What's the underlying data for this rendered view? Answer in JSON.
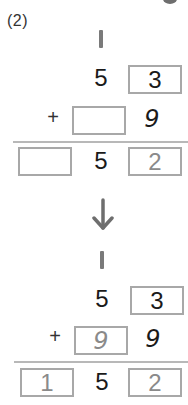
{
  "problem": {
    "label": "(2)"
  },
  "before": {
    "carry": "1",
    "top_row": {
      "tens": "5",
      "ones_box": "3"
    },
    "operator": "+",
    "second_row": {
      "tens_box": "",
      "ones": "9"
    },
    "result_row": {
      "hundreds_box": "",
      "tens": "5",
      "ones_box": "2"
    }
  },
  "transition": {
    "icon": "arrow-down-icon",
    "glyph": "↓"
  },
  "after": {
    "carry": "1",
    "top_row": {
      "tens": "5",
      "ones_box": "3"
    },
    "operator": "+",
    "second_row": {
      "tens_box": "9",
      "ones": "9"
    },
    "result_row": {
      "hundreds_box": "1",
      "tens": "5",
      "ones_box": "2"
    }
  },
  "colors": {
    "box_border": "#a8a8a8",
    "answer_text": "#8a8a8a",
    "digit_text": "#1a1a1a",
    "rule": "#b8b8b8",
    "arrow": "#6e6e6e"
  }
}
